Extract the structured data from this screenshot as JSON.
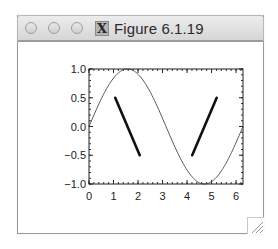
{
  "window": {
    "title": "Figure 6.1.19",
    "buttons": [
      "close",
      "minimize",
      "zoom"
    ],
    "app_icon": "x11-icon",
    "app_icon_glyph": "X"
  },
  "chart_data": {
    "type": "line",
    "title": "",
    "xlabel": "",
    "ylabel": "",
    "xlim": [
      0,
      6.2832
    ],
    "ylim": [
      -1.0,
      1.0
    ],
    "xticks": [
      0,
      1,
      2,
      3,
      4,
      5,
      6
    ],
    "xtick_labels": [
      "0",
      "1",
      "2",
      "3",
      "4",
      "5",
      "6"
    ],
    "yticks": [
      1.0,
      0.5,
      0.0,
      -0.5,
      -1.0
    ],
    "ytick_labels": [
      "1.0",
      "0.5",
      "0.0",
      "−0.5",
      "−1.0"
    ],
    "grid": false,
    "legend": "none",
    "series": [
      {
        "name": "sin(x)",
        "style": "thin",
        "function": "sin",
        "x_range": [
          0,
          6.2832
        ],
        "color": "#555555"
      },
      {
        "name": "segment-1",
        "style": "thick",
        "x": [
          1.07,
          2.07
        ],
        "y": [
          0.5,
          -0.5
        ],
        "color": "#111111"
      },
      {
        "name": "segment-2",
        "style": "thick",
        "x": [
          4.21,
          5.21
        ],
        "y": [
          -0.5,
          0.5
        ],
        "color": "#111111"
      }
    ]
  }
}
